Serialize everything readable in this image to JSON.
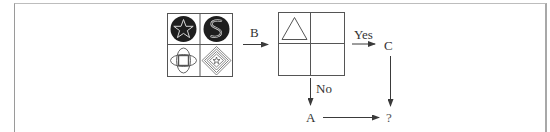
{
  "diagram": {
    "type": "flowchart-puzzle",
    "source_grid": {
      "cells": [
        {
          "position": "top-left",
          "figure": "white star outline in black circle"
        },
        {
          "position": "top-right",
          "figure": "white S-shape outline in black circle"
        },
        {
          "position": "bottom-left",
          "figure": "square overlapped by four ellipse lobes"
        },
        {
          "position": "bottom-right",
          "figure": "nested diamonds with small star at center"
        }
      ]
    },
    "arrow_to_target": {
      "label": "B"
    },
    "target_grid": {
      "cells": [
        {
          "position": "top-left",
          "figure": "triangle outline"
        },
        {
          "position": "top-right",
          "figure": ""
        },
        {
          "position": "bottom-left",
          "figure": ""
        },
        {
          "position": "bottom-right",
          "figure": ""
        }
      ]
    },
    "branches": {
      "yes_label": "Yes",
      "no_label": "No"
    },
    "nodes": {
      "c": "C",
      "a": "A",
      "result": "?"
    },
    "colors": {
      "line": "#3a3a3a",
      "fill_dark": "#1e1e1e",
      "frame": "#a8a8a8"
    }
  }
}
